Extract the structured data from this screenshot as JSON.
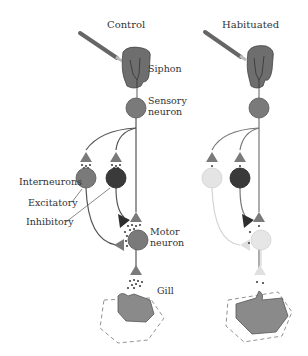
{
  "panels": [
    {
      "title": "Control",
      "state": "control"
    },
    {
      "title": "Habituated",
      "state": "habituated"
    }
  ],
  "labels": {
    "siphon": "Siphon",
    "sensory_line1": "Sensory",
    "sensory_line2": "neuron",
    "interneurons": "Interneurons",
    "excitatory": "Excitatory",
    "inhibitory": "Inhibitory",
    "motor_line1": "Motor",
    "motor_line2": "neuron",
    "gill": "Gill"
  },
  "colors": {
    "neuron_gray": "#7a7a7a",
    "inhibitory_dark": "#3a3a3a",
    "habituated_faded": "#dcdcdc",
    "tissue": "#8a8a8a",
    "line": "#555555"
  }
}
